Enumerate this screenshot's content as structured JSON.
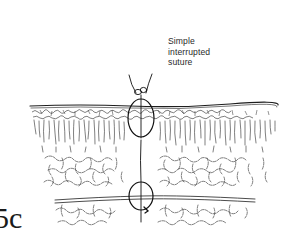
{
  "figure": {
    "number": "5c",
    "title_lines": [
      "Simple",
      "interrupted",
      "suture"
    ]
  },
  "layers": [
    {
      "name": "epidermis",
      "style": "irregular cellular band under wavy surface line"
    },
    {
      "name": "dermis",
      "style": "vertical fibrous striations"
    },
    {
      "name": "subcutaneous-tissue",
      "style": "irregular cellular network"
    },
    {
      "name": "fascia",
      "style": "double horizontal line"
    }
  ],
  "suture": {
    "type": "simple interrupted",
    "upper_loop": {
      "cx": 141,
      "cy": 118,
      "rx": 13,
      "ry": 18
    },
    "lower_loop": {
      "cx": 141,
      "cy": 195,
      "rx": 12,
      "ry": 13
    },
    "knot": {
      "x": 141,
      "y": 90
    },
    "needle_track_x": 141
  },
  "colors": {
    "ink": "#1e1e1e",
    "background": "#ffffff"
  }
}
